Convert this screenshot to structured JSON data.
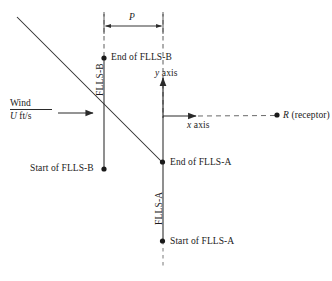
{
  "figure": {
    "width": 332,
    "height": 281,
    "background": "#ffffff",
    "line_color": "#2a2a2a",
    "text_color": "#1a1a1a"
  },
  "labels": {
    "dimension_p": "P",
    "flls_b_vertical": "FLLS-B",
    "flls_a_vertical": "FLLS-A",
    "end_of_flls_b": "End of FLLS-B",
    "start_of_flls_b": "Start of FLLS-B",
    "end_of_flls_a": "End of FLLS-A",
    "start_of_flls_a": "Start of FLLS-A",
    "y_axis": "y axis",
    "y_axis_symbol": "y",
    "y_axis_word": "axis",
    "x_axis": "x axis",
    "x_axis_symbol": "x",
    "x_axis_word": "axis",
    "receptor": "R (receptor)",
    "receptor_symbol": "R",
    "receptor_word": "(receptor)",
    "wind_numerator": "Wind",
    "wind_denominator_symbol": "U",
    "wind_denominator_units": "ft/s"
  },
  "geometry": {
    "origin": {
      "x": 163,
      "y": 118
    },
    "flls_b_line_x": 104,
    "flls_a_line_x": 163,
    "dimension_line_y": 26,
    "dimension_left_x": 104,
    "dimension_right_x": 163,
    "y_axis_arrow_tip_y": 76,
    "x_axis_arrow_tip_x": 197,
    "wind_arrow_start_x": 58,
    "wind_arrow_tip_x": 94,
    "wind_arrow_y": 113,
    "receptor_dot": {
      "x": 277,
      "y": 115
    },
    "diagonal_start": {
      "x": 17,
      "y": 17
    },
    "diagonal_end": {
      "x": 162,
      "y": 162
    }
  },
  "points": [
    {
      "name": "end-of-flls-b",
      "x": 104,
      "y": 58,
      "label": "End of FLLS-B"
    },
    {
      "name": "start-of-flls-b",
      "x": 104,
      "y": 169,
      "label": "Start of FLLS-B"
    },
    {
      "name": "end-of-flls-a",
      "x": 162,
      "y": 162,
      "label": "End of FLLS-A"
    },
    {
      "name": "start-of-flls-a",
      "x": 162,
      "y": 241,
      "label": "Start of FLLS-A"
    },
    {
      "name": "receptor",
      "x": 277,
      "y": 115,
      "label": "R (receptor)"
    }
  ]
}
